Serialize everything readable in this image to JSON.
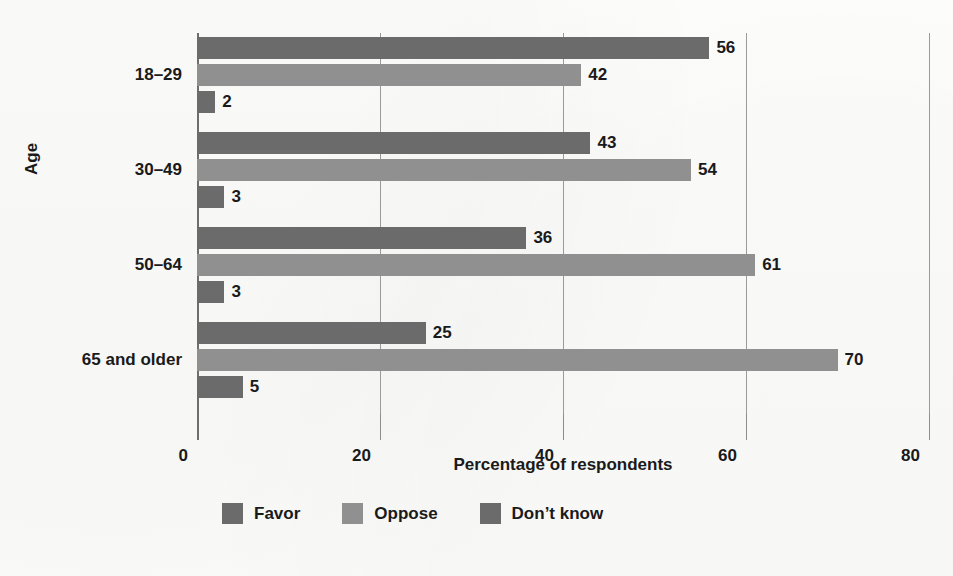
{
  "chart_data": {
    "type": "bar",
    "orientation": "horizontal",
    "title": "",
    "xlabel": "Percentage of respondents",
    "ylabel": "Age",
    "categories": [
      "18–29",
      "30–49",
      "50–64",
      "65 and older"
    ],
    "series": [
      {
        "name": "Favor",
        "color": "#6b6b6b",
        "values": [
          56,
          43,
          36,
          25
        ]
      },
      {
        "name": "Oppose",
        "color": "#909090",
        "values": [
          42,
          54,
          61,
          70
        ]
      },
      {
        "name": "Don’t know",
        "color": "#6b6b6b",
        "values": [
          2,
          3,
          3,
          5
        ]
      }
    ],
    "xlim": [
      0,
      80
    ],
    "xticks": [
      0,
      20,
      40,
      60,
      80
    ],
    "xticklabels": [
      "0",
      "20",
      "40",
      "60",
      "80"
    ],
    "grid": "vertical",
    "data_labels": true,
    "legend_position": "bottom"
  },
  "axis": {
    "y_title": "Age",
    "x_title": "Percentage of respondents",
    "ticks": [
      {
        "label": "0",
        "value": 0
      },
      {
        "label": "20",
        "value": 20
      },
      {
        "label": "40",
        "value": 40
      },
      {
        "label": "60",
        "value": 60
      },
      {
        "label": "80",
        "value": 80
      }
    ]
  },
  "categories": [
    {
      "label": "18–29",
      "bars": [
        {
          "series": "Favor",
          "value": 56,
          "label": "56",
          "style": "favor"
        },
        {
          "series": "Oppose",
          "value": 42,
          "label": "42",
          "style": "oppose"
        },
        {
          "series": "Don’t know",
          "value": 2,
          "label": "2",
          "style": "dontknow"
        }
      ]
    },
    {
      "label": "30–49",
      "bars": [
        {
          "series": "Favor",
          "value": 43,
          "label": "43",
          "style": "favor"
        },
        {
          "series": "Oppose",
          "value": 54,
          "label": "54",
          "style": "oppose"
        },
        {
          "series": "Don’t know",
          "value": 3,
          "label": "3",
          "style": "dontknow"
        }
      ]
    },
    {
      "label": "50–64",
      "bars": [
        {
          "series": "Favor",
          "value": 36,
          "label": "36",
          "style": "favor"
        },
        {
          "series": "Oppose",
          "value": 61,
          "label": "61",
          "style": "oppose"
        },
        {
          "series": "Don’t know",
          "value": 3,
          "label": "3",
          "style": "dontknow"
        }
      ]
    },
    {
      "label": "65 and older",
      "bars": [
        {
          "series": "Favor",
          "value": 25,
          "label": "25",
          "style": "favor"
        },
        {
          "series": "Oppose",
          "value": 70,
          "label": "70",
          "style": "oppose"
        },
        {
          "series": "Don’t know",
          "value": 5,
          "label": "5",
          "style": "dontknow"
        }
      ]
    }
  ],
  "legend": [
    {
      "label": "Favor",
      "style": "favor",
      "color": "#6b6b6b"
    },
    {
      "label": "Oppose",
      "style": "oppose",
      "color": "#909090"
    },
    {
      "label": "Don’t know",
      "style": "dontknow",
      "color": "#6b6b6b"
    }
  ]
}
